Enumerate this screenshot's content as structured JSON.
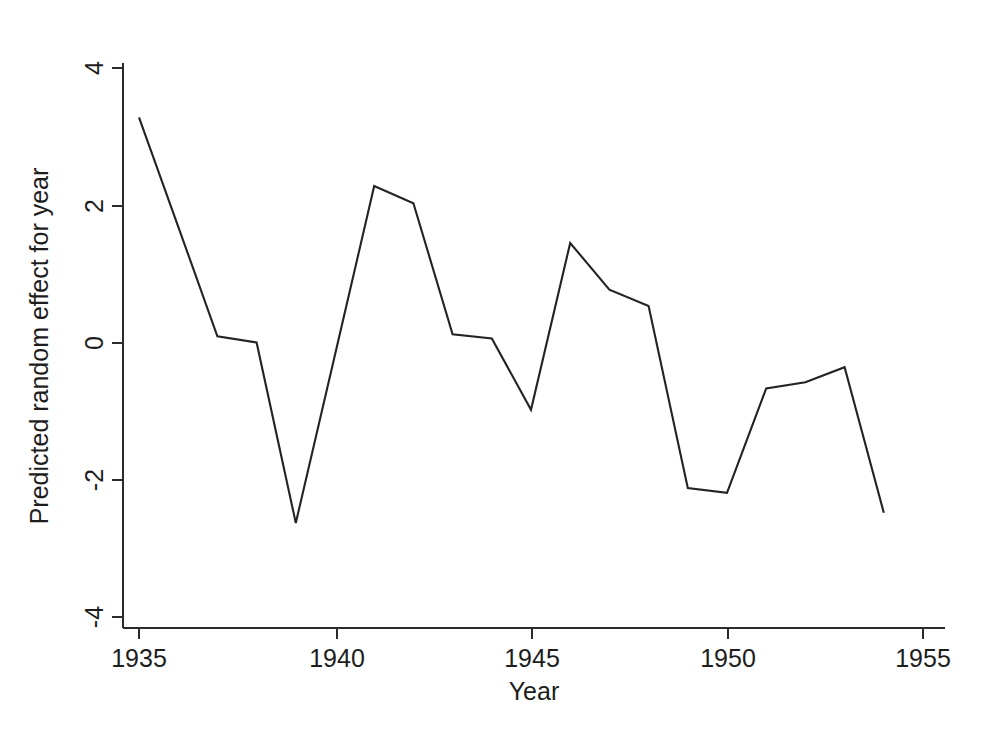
{
  "figure": {
    "background_color": "#ffffff",
    "line_color": "#232323",
    "axis_color": "#2b2b2b"
  },
  "axis": {
    "x_label": "Year",
    "y_label": "Predicted random effect for year",
    "x_ticks": [
      "1935",
      "1940",
      "1945",
      "1950",
      "1955"
    ],
    "y_ticks": [
      "4",
      "2",
      "0",
      "-2",
      "-4"
    ]
  },
  "chart_data": {
    "type": "line",
    "title": "",
    "xlabel": "Year",
    "ylabel": "Predicted random effect for year",
    "xlim": [
      1935,
      1955
    ],
    "ylim": [
      -4,
      4
    ],
    "xticks": [
      1935,
      1940,
      1945,
      1950,
      1955
    ],
    "yticks": [
      4,
      2,
      0,
      -2,
      -4
    ],
    "grid": false,
    "legend": false,
    "x": [
      1935,
      1936,
      1937,
      1938,
      1939,
      1940,
      1941,
      1942,
      1943,
      1944,
      1945,
      1946,
      1947,
      1948,
      1949,
      1950,
      1951,
      1952,
      1953,
      1954
    ],
    "series": [
      {
        "name": "Predicted random effect for year",
        "values": [
          3.28,
          1.69,
          0.09,
          0.0,
          -2.63,
          -0.18,
          2.28,
          2.03,
          0.12,
          0.06,
          -0.98,
          1.45,
          0.77,
          0.53,
          -2.12,
          -2.19,
          -0.67,
          -0.58,
          -0.36,
          -2.48
        ]
      }
    ]
  },
  "geometry": {
    "plot_left": 123,
    "plot_right": 945,
    "plot_bottom": 628,
    "plot_top": 63,
    "x_tick_px": [
      139,
      337,
      532,
      728,
      923
    ],
    "y_tick_px": [
      68,
      206,
      343,
      480,
      617
    ]
  }
}
